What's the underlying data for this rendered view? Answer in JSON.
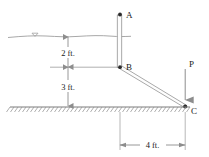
{
  "figure": {
    "type": "engineering-diagram",
    "colors": {
      "line": "#8d8d8d",
      "member_edge": "#9a9a9a",
      "ground": "#7a7a7a",
      "water": "#9e9e9e",
      "text": "#1a1a1a",
      "marker": "#2b2b2b",
      "background": "#ffffff"
    },
    "points": [
      {
        "id": "A",
        "label": "A",
        "x": 120,
        "y": 14,
        "note": "top end of vertical post"
      },
      {
        "id": "B",
        "label": "B",
        "x": 120,
        "y": 67,
        "note": "joint between post and strut"
      },
      {
        "id": "C",
        "label": "C",
        "x": 185,
        "y": 107,
        "note": "base of strut at ground level"
      }
    ],
    "members": [
      {
        "id": "AB",
        "from": "A",
        "to": "B",
        "style": "double-line",
        "orientation": "vertical"
      },
      {
        "id": "BC",
        "from": "B",
        "to": "C",
        "style": "double-line",
        "orientation": "inclined"
      }
    ],
    "load": {
      "label": "P",
      "direction": "down",
      "applied_at": "C",
      "label_x": 186,
      "label_y": 64
    },
    "surfaces": [
      {
        "id": "water-surface",
        "label": "water-level",
        "y": 36,
        "symbol": "triangle"
      },
      {
        "id": "ground-surface",
        "label": "ground-level",
        "y": 107,
        "hatch": "diagonal"
      }
    ],
    "dimensions": [
      {
        "id": "dim-2ft",
        "label": "2 ft.",
        "value": 2,
        "unit": "ft.",
        "orientation": "vertical",
        "from": "water-surface",
        "to": "B-level",
        "label_x": 67,
        "label_y": 54
      },
      {
        "id": "dim-3ft",
        "label": "3 ft.",
        "value": 3,
        "unit": "ft.",
        "orientation": "vertical",
        "from": "B-level",
        "to": "ground-surface",
        "label_x": 67,
        "label_y": 90
      },
      {
        "id": "dim-4ft",
        "label": "4 ft.",
        "value": 4,
        "unit": "ft.",
        "orientation": "horizontal",
        "from": "B-vertical",
        "to": "C-vertical",
        "label_x": 152,
        "label_y": 148
      }
    ]
  }
}
